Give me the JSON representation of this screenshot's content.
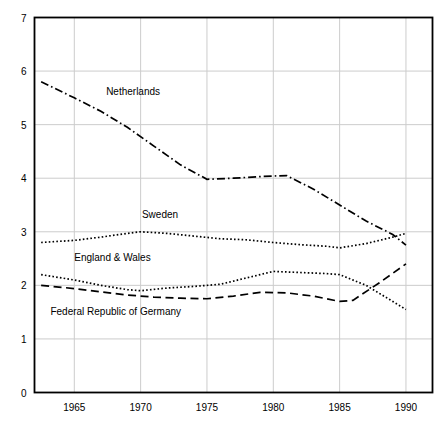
{
  "chart_data": {
    "type": "line",
    "title": "",
    "subtitle": "",
    "xlabel": "",
    "ylabel": "",
    "xlim": [
      1962,
      1992
    ],
    "ylim": [
      0,
      7
    ],
    "xticks": [
      "1965",
      "1970",
      "1975",
      "1980",
      "1985",
      "1990"
    ],
    "xtick_values": [
      1965,
      1970,
      1975,
      1980,
      1985,
      1990
    ],
    "yticks": [
      "0",
      "1",
      "2",
      "3",
      "4",
      "5",
      "6",
      "7"
    ],
    "ytick_values": [
      0,
      1,
      2,
      3,
      4,
      5,
      6,
      7
    ],
    "grid": true,
    "grid_axis": "both",
    "grid_color": "#cccccc",
    "legend": "inline-labels",
    "line_color": "#000000",
    "background": "#ffffff",
    "frame_color": "#000000",
    "series": [
      {
        "name": "Netherlands",
        "style": "dash-dot",
        "label_x": 1967.4,
        "label_y": 5.55,
        "x": [
          1962.5,
          1965,
          1967,
          1969,
          1971,
          1973,
          1975,
          1977,
          1979,
          1981,
          1983,
          1985,
          1987,
          1989,
          1990
        ],
        "values": [
          5.8,
          5.5,
          5.25,
          4.95,
          4.6,
          4.25,
          3.98,
          4.0,
          4.03,
          4.05,
          3.8,
          3.5,
          3.2,
          2.95,
          2.75
        ]
      },
      {
        "name": "Sweden",
        "style": "dotted",
        "label_x": 1970.1,
        "label_y": 3.25,
        "x": [
          1962.5,
          1965,
          1967,
          1969,
          1970,
          1972,
          1974,
          1976,
          1978,
          1980,
          1982,
          1984,
          1985,
          1987,
          1989,
          1990
        ],
        "values": [
          2.8,
          2.84,
          2.9,
          2.97,
          3.0,
          2.97,
          2.92,
          2.87,
          2.85,
          2.8,
          2.76,
          2.73,
          2.7,
          2.78,
          2.9,
          2.97
        ]
      },
      {
        "name": "England & Wales",
        "style": "dotted",
        "label_x": 1965.0,
        "label_y": 2.46,
        "x": [
          1962.5,
          1965,
          1967,
          1969,
          1970,
          1972,
          1974,
          1976,
          1978,
          1980,
          1982,
          1984,
          1985,
          1987,
          1988,
          1990
        ],
        "values": [
          2.2,
          2.1,
          2.0,
          1.92,
          1.9,
          1.95,
          1.98,
          2.02,
          2.14,
          2.26,
          2.24,
          2.22,
          2.2,
          2.0,
          1.85,
          1.55
        ]
      },
      {
        "name": "Federal Republic of Germany",
        "style": "dashed",
        "label_x": 1963.2,
        "label_y": 1.45,
        "x": [
          1962.5,
          1965,
          1967,
          1969,
          1971,
          1973,
          1975,
          1977,
          1979,
          1981,
          1983,
          1985,
          1986,
          1988,
          1990
        ],
        "values": [
          2.0,
          1.94,
          1.88,
          1.82,
          1.78,
          1.76,
          1.75,
          1.8,
          1.87,
          1.86,
          1.8,
          1.7,
          1.72,
          2.05,
          2.4
        ]
      }
    ]
  }
}
